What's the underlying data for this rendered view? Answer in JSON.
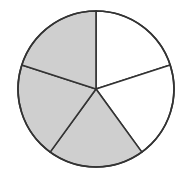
{
  "diagram": {
    "type": "fraction-circle",
    "total_parts": 5,
    "shaded_parts": 3,
    "fraction": "3/5",
    "center": [
      96,
      89
    ],
    "radius": 78,
    "start_angle_deg": 0,
    "colors": {
      "shaded": "#cfcfcf",
      "unshaded": "#ffffff",
      "stroke": "#333333"
    },
    "sectors": [
      {
        "index": 0,
        "from_deg": 0,
        "to_deg": 72,
        "shaded": false
      },
      {
        "index": 1,
        "from_deg": 72,
        "to_deg": 144,
        "shaded": false
      },
      {
        "index": 2,
        "from_deg": 144,
        "to_deg": 216,
        "shaded": true
      },
      {
        "index": 3,
        "from_deg": 216,
        "to_deg": 288,
        "shaded": true
      },
      {
        "index": 4,
        "from_deg": 288,
        "to_deg": 360,
        "shaded": true
      }
    ]
  }
}
